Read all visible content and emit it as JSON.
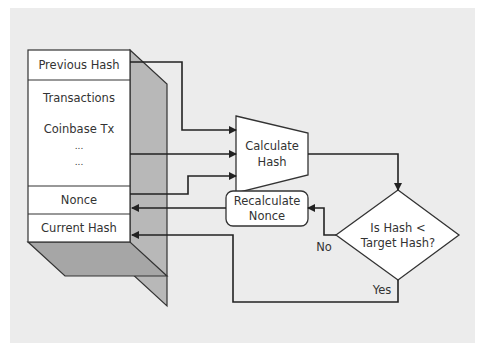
{
  "block": {
    "fields": [
      {
        "label": "Previous Hash"
      },
      {
        "label": "Transactions"
      },
      {
        "label": "Coinbase Tx"
      },
      {
        "label": "..."
      },
      {
        "label": "..."
      },
      {
        "label": "Nonce"
      },
      {
        "label": "Current Hash"
      }
    ]
  },
  "process": {
    "calculate_hash": {
      "line1": "Calculate",
      "line2": "Hash"
    },
    "recalculate_nonce": {
      "line1": "Recalculate",
      "line2": "Nonce"
    }
  },
  "decision": {
    "line1": "Is Hash <",
    "line2": "Target Hash?",
    "no_label": "No",
    "yes_label": "Yes"
  },
  "colors": {
    "background": "#ececec",
    "box_fill": "#ffffff",
    "side_shade": "#b8b8b8",
    "bottom_shade": "#a8a8a8",
    "line": "#222222"
  }
}
